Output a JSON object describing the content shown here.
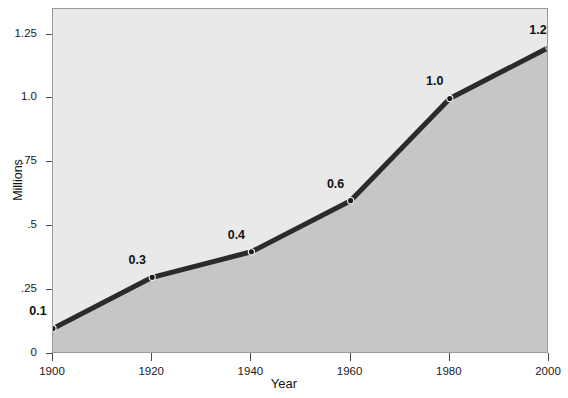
{
  "chart_data": {
    "type": "line",
    "title": "",
    "subtitle": "",
    "xlabel": "Year",
    "ylabel": "Millions",
    "x": [
      1900,
      1920,
      1940,
      1960,
      1980,
      2000
    ],
    "values": [
      0.1,
      0.3,
      0.4,
      0.6,
      1.0,
      1.2
    ],
    "point_labels": [
      "0.1",
      "0.3",
      "0.4",
      "0.6",
      "1.0",
      "1.2"
    ],
    "xtick_labels": [
      "1900",
      "1920",
      "1940",
      "1960",
      "1980",
      "2000"
    ],
    "ytick_values": [
      0,
      0.25,
      0.5,
      0.75,
      1.0,
      1.25
    ],
    "ytick_labels": [
      "0",
      ".25",
      ".5",
      ".75",
      "1.0",
      "1.25"
    ],
    "xlim": [
      1900,
      2000
    ],
    "ylim": [
      0,
      1.35
    ],
    "grid": false,
    "legend": false,
    "legend_position": "none",
    "area_filled": true,
    "markers": true
  },
  "style": {
    "plot_background": "#e9e9e9",
    "area_fill": "#c6c6c6",
    "line_color": "#2b2b2b",
    "marker_color": "#1a1a1a",
    "frame_color": "#9a9a9a",
    "text_color": "#111111",
    "page_background": "#ffffff"
  }
}
